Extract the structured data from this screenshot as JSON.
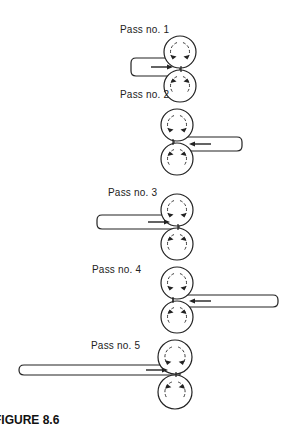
{
  "figure": {
    "caption": "FIGURE 8.6",
    "stroke_color": "#222222",
    "background": "#ffffff"
  },
  "passes": [
    {
      "label": "Pass no. 1",
      "label_x": 120,
      "label_y": 30,
      "roll_cx": 180,
      "top_cy": 52,
      "bot_cy": 86,
      "r": 16,
      "bar_x1": 131,
      "bar_x2": 180,
      "bar_y1": 58,
      "bar_y2": 76,
      "direction": "right"
    },
    {
      "label": "Pass no. 2",
      "label_x": 120,
      "label_y": 95,
      "roll_cx": 177,
      "top_cy": 125,
      "bot_cy": 159,
      "r": 16,
      "bar_x1": 174,
      "bar_x2": 242,
      "bar_y1": 137,
      "bar_y2": 151,
      "direction": "left"
    },
    {
      "label": "Pass no. 3",
      "label_x": 108,
      "label_y": 193,
      "roll_cx": 177,
      "top_cy": 210,
      "bot_cy": 244,
      "r": 16,
      "bar_x1": 97,
      "bar_x2": 179,
      "bar_y1": 215,
      "bar_y2": 229,
      "direction": "right"
    },
    {
      "label": "Pass no. 4",
      "label_x": 92,
      "label_y": 270,
      "roll_cx": 177,
      "top_cy": 283,
      "bot_cy": 317,
      "r": 16,
      "bar_x1": 173,
      "bar_x2": 278,
      "bar_y1": 295,
      "bar_y2": 307,
      "direction": "left"
    },
    {
      "label": "Pass no. 5",
      "label_x": 91,
      "label_y": 346,
      "roll_cx": 175,
      "top_cy": 357,
      "bot_cy": 392,
      "r": 17,
      "bar_x1": 19,
      "bar_x2": 180,
      "bar_y1": 365,
      "bar_y2": 375,
      "direction": "right"
    }
  ]
}
